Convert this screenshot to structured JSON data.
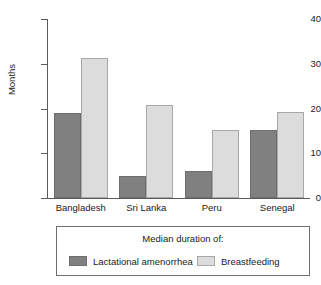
{
  "chart_data": {
    "type": "bar",
    "title": "",
    "xlabel": "",
    "ylabel": "Months",
    "ylim": [
      0,
      40
    ],
    "yticks": [
      0,
      10,
      20,
      30,
      40
    ],
    "ytick_labels": [
      "0",
      "10",
      "20",
      "30",
      "40"
    ],
    "grid": false,
    "legend_position": "bottom",
    "legend_title": "Median duration of:",
    "categories": [
      "Bangladesh",
      "Sri Lanka",
      "Peru",
      "Senegal"
    ],
    "series": [
      {
        "name": "Lactational amenorrhea",
        "color": "#808080",
        "values": [
          19,
          5,
          6,
          15.2
        ]
      },
      {
        "name": "Breastfeeding",
        "color": "#dcdcdc",
        "values": [
          31.4,
          20.7,
          15.2,
          19.2
        ]
      }
    ]
  },
  "legend": {
    "title": "Median duration of:",
    "entries": [
      {
        "label": "Lactational amenorrhea",
        "swatch": "dark"
      },
      {
        "label": "Breastfeeding",
        "swatch": "light"
      }
    ]
  },
  "colors": {
    "series_dark": "#808080",
    "series_light": "#dcdcdc",
    "axis": "#5a5a5a",
    "text": "#1a1a1a",
    "background": "#ffffff"
  }
}
